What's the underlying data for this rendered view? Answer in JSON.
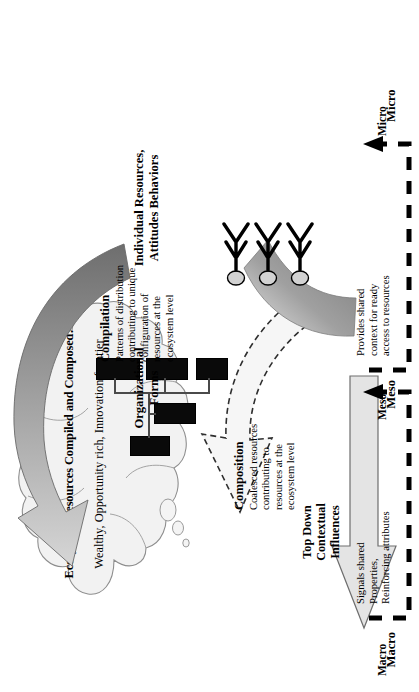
{
  "figure": {
    "type": "multilevel-ecosystem-model-diagram",
    "orientation": "rotated-90-counterclockwise",
    "background_color": "#ffffff"
  },
  "cloud": {
    "name": "ecosystem-resources-cloud",
    "title": "Ecosystem Resources Compiled and Composed:",
    "subtitle": "Wealthy, Opportunity rich, Innovation frontier",
    "fill_color": "#f2f2f2",
    "stroke_color": "#8a8a8a",
    "bubble_count": 3
  },
  "levels": [
    {
      "id": "macro",
      "label": "Macro",
      "note": "Signals shared\nProperties,\nReinforcing attributes",
      "note_lines": [
        "Signals shared",
        "Properties,",
        "Reinforcing attributes"
      ],
      "bracket_style": "dashed"
    },
    {
      "id": "meso",
      "label": "Meso",
      "note": "Provides shared\ncontext for ready\naccess to resources",
      "note_lines": [
        "Provides shared",
        "context for ready",
        "access to resources"
      ],
      "bracket_style": "dashed"
    },
    {
      "id": "micro",
      "label": "Micro",
      "note": "",
      "note_lines": [],
      "bracket_style": "dashed"
    }
  ],
  "processes": {
    "compilation": {
      "title": "Compilation",
      "body_lines": [
        "Patterns of distribution",
        "contributing to unique",
        "configuration of",
        "resources at the",
        "ecosystem level"
      ],
      "body": "Patterns of distribution contributing to unique configuration of resources at the ecosystem level",
      "arrow_style": "curved-solid-gradient-gray",
      "arrow_color_start": "#d9d9d9",
      "arrow_color_end": "#707070"
    },
    "composition": {
      "title": "Composition",
      "body_lines": [
        "Coalesced resources",
        "contributing to",
        "resources at the",
        "ecosystem level"
      ],
      "body": "Coalesced resources contributing to resources at the ecosystem level",
      "arrow_style": "curved-dashed-outline",
      "arrow_color": "#f4f4f4",
      "arrow_stroke": "#3a3a3a"
    },
    "top_down": {
      "title_lines": [
        "Top Down",
        "Contextual",
        "Influences"
      ],
      "title": "Top Down Contextual Influences",
      "arrow_style": "straight-block-arrow",
      "arrow_color": "#e2e2e2",
      "arrow_stroke": "#6e6e6e"
    }
  },
  "entities": {
    "organizational_forms": {
      "label_lines": [
        "Organizational",
        "Forms"
      ],
      "label": "Organizational Forms",
      "icon": "org-chart-icon",
      "box_count": 5,
      "box_color": "#0a0a0a"
    },
    "individual": {
      "label_lines": [
        "Individual  Resources,",
        "Attitudes Behaviors"
      ],
      "label": "Individual Resources, Attitudes Behaviors",
      "icon": "people-icon",
      "person_count": 3,
      "head_color": "#d2d2d2",
      "body_color": "#000000"
    }
  }
}
